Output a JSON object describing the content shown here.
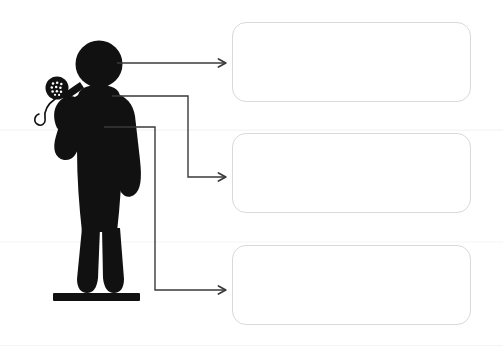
{
  "page": {
    "kind": "labeling-diagram-worksheet",
    "background_color": "#ffffff",
    "width": 503,
    "height": 349
  },
  "illustration": {
    "name": "person-with-microphone-silhouette",
    "fill_color": "#111111",
    "description": "Black silhouette pictogram of a standing person holding a handheld microphone up toward the mouth, standing on a solid black base bar.",
    "parts": [
      {
        "name": "head",
        "shape": "circle"
      },
      {
        "name": "torso",
        "shape": "rounded-body"
      },
      {
        "name": "raised-arm",
        "shape": "bent-arm-holding-microphone"
      },
      {
        "name": "lowered-arm",
        "shape": "arm-at-side"
      },
      {
        "name": "left-leg",
        "shape": "leg"
      },
      {
        "name": "right-leg",
        "shape": "leg"
      },
      {
        "name": "microphone",
        "shape": "circle-grille-with-handle"
      },
      {
        "name": "microphone-cord",
        "shape": "curved-cable"
      },
      {
        "name": "base-bar",
        "shape": "horizontal-bar"
      }
    ]
  },
  "connectors": {
    "stroke_color": "#3a3a3a",
    "stroke_width": 1.4,
    "arrowhead_style": "open-chevron",
    "items": [
      {
        "id": "connector-1",
        "name": "connector-to-box-1",
        "from": "head",
        "to": "label-box-1",
        "route": "straight",
        "path": "M 117 63 L 226 63"
      },
      {
        "id": "connector-2",
        "name": "connector-to-box-2",
        "from": "shoulder",
        "to": "label-box-2",
        "route": "elbow",
        "path": "M 112 96 L 188 96 L 188 177 L 226 177"
      },
      {
        "id": "connector-3",
        "name": "connector-to-box-3",
        "from": "torso",
        "to": "label-box-3",
        "route": "elbow",
        "path": "M 104 127 L 155 127 L 155 290 L 226 290"
      }
    ]
  },
  "label_boxes": [
    {
      "id": "box1",
      "name": "label-box-1",
      "text": "",
      "placeholder": "",
      "border_color": "#d9d9d9",
      "fill_color": "#ffffff",
      "corner_radius": 14,
      "state": "empty"
    },
    {
      "id": "box2",
      "name": "label-box-2",
      "text": "",
      "placeholder": "",
      "border_color": "#d9d9d9",
      "fill_color": "#ffffff",
      "corner_radius": 14,
      "state": "empty"
    },
    {
      "id": "box3",
      "name": "label-box-3",
      "text": "",
      "placeholder": "",
      "border_color": "#d9d9d9",
      "fill_color": "#ffffff",
      "corner_radius": 14,
      "state": "empty"
    }
  ]
}
